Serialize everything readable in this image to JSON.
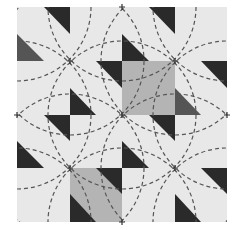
{
  "pattern": {
    "origin": [
      17,
      7
    ],
    "cell_size": 52.5,
    "rows": 4,
    "cols": 4,
    "colors": {
      "background": "#e8e8e8",
      "dark": "#2a2a2a",
      "medium_dark": "#555555",
      "gray_square": "#b4b4b4",
      "dashed_line": "#555555",
      "page": "#ffffff"
    },
    "gray_squares": [
      {
        "col": 2,
        "row": 1
      },
      {
        "col": 1,
        "row": 2.5
      }
    ],
    "triangles": [
      {
        "points": [
          [
            44,
            7
          ],
          [
            70,
            7
          ],
          [
            70,
            34
          ]
        ],
        "tone": "dark"
      },
      {
        "points": [
          [
            17,
            34
          ],
          [
            17,
            61
          ],
          [
            44,
            61
          ]
        ],
        "tone": "medium_dark"
      },
      {
        "points": [
          [
            149,
            7
          ],
          [
            175,
            7
          ],
          [
            175,
            34
          ]
        ],
        "tone": "dark"
      },
      {
        "points": [
          [
            122,
            34
          ],
          [
            122,
            61
          ],
          [
            149,
            61
          ]
        ],
        "tone": "dark"
      },
      {
        "points": [
          [
            96,
            61
          ],
          [
            122,
            61
          ],
          [
            122,
            88
          ]
        ],
        "tone": "dark"
      },
      {
        "points": [
          [
            201,
            61
          ],
          [
            227,
            61
          ],
          [
            227,
            88
          ]
        ],
        "tone": "dark"
      },
      {
        "points": [
          [
            70,
            88
          ],
          [
            70,
            115
          ],
          [
            96,
            115
          ]
        ],
        "tone": "dark"
      },
      {
        "points": [
          [
            175,
            88
          ],
          [
            175,
            115
          ],
          [
            201,
            115
          ]
        ],
        "tone": "medium_dark"
      },
      {
        "points": [
          [
            44,
            115
          ],
          [
            70,
            115
          ],
          [
            70,
            141
          ]
        ],
        "tone": "dark"
      },
      {
        "points": [
          [
            149,
            115
          ],
          [
            175,
            115
          ],
          [
            175,
            141
          ]
        ],
        "tone": "dark"
      },
      {
        "points": [
          [
            17,
            141
          ],
          [
            17,
            168
          ],
          [
            44,
            168
          ]
        ],
        "tone": "dark"
      },
      {
        "points": [
          [
            122,
            141
          ],
          [
            122,
            168
          ],
          [
            149,
            168
          ]
        ],
        "tone": "dark"
      },
      {
        "points": [
          [
            96,
            168
          ],
          [
            122,
            168
          ],
          [
            122,
            194
          ]
        ],
        "tone": "dark"
      },
      {
        "points": [
          [
            201,
            168
          ],
          [
            227,
            168
          ],
          [
            227,
            194
          ]
        ],
        "tone": "dark"
      },
      {
        "points": [
          [
            70,
            194
          ],
          [
            70,
            222
          ],
          [
            96,
            222
          ]
        ],
        "tone": "dark"
      },
      {
        "points": [
          [
            175,
            194
          ],
          [
            175,
            222
          ],
          [
            201,
            222
          ]
        ],
        "tone": "dark"
      }
    ],
    "circle_centers": [
      [
        17,
        7
      ],
      [
        122,
        7
      ],
      [
        227,
        7
      ],
      [
        70,
        61
      ],
      [
        175,
        61
      ],
      [
        17,
        115
      ],
      [
        122,
        115
      ],
      [
        227,
        115
      ],
      [
        70,
        168
      ],
      [
        175,
        168
      ],
      [
        17,
        222
      ],
      [
        122,
        222
      ],
      [
        227,
        222
      ]
    ],
    "circle_radius": 74,
    "cross_marks": [
      [
        70,
        61
      ],
      [
        175,
        61
      ],
      [
        122,
        115
      ],
      [
        70,
        168
      ],
      [
        175,
        168
      ],
      [
        17,
        115
      ],
      [
        227,
        115
      ],
      [
        122,
        7
      ],
      [
        122,
        222
      ]
    ]
  }
}
